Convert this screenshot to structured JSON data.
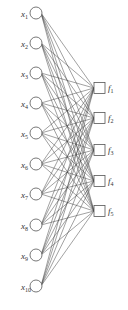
{
  "diagram": {
    "type": "neural-network",
    "inputs": [
      {
        "name": "x",
        "sub": "1",
        "y": 13
      },
      {
        "name": "x",
        "sub": "2",
        "y": 43
      },
      {
        "name": "x",
        "sub": "3",
        "y": 73
      },
      {
        "name": "x",
        "sub": "4",
        "y": 103
      },
      {
        "name": "x",
        "sub": "5",
        "y": 133
      },
      {
        "name": "x",
        "sub": "6",
        "y": 164
      },
      {
        "name": "x",
        "sub": "7",
        "y": 194
      },
      {
        "name": "x",
        "sub": "8",
        "y": 225
      },
      {
        "name": "x",
        "sub": "9",
        "y": 255
      },
      {
        "name": "x",
        "sub": "10",
        "y": 286
      }
    ],
    "outputs": [
      {
        "name": "f",
        "sub": "1",
        "y": 88
      },
      {
        "name": "f",
        "sub": "2",
        "y": 118
      },
      {
        "name": "f",
        "sub": "3",
        "y": 150
      },
      {
        "name": "f",
        "sub": "4",
        "y": 181
      },
      {
        "name": "f",
        "sub": "5",
        "y": 211
      }
    ],
    "connectivity": "fully-connected",
    "colors": {
      "stroke": "#555555",
      "edge": "#444444",
      "background": "#ffffff"
    }
  }
}
